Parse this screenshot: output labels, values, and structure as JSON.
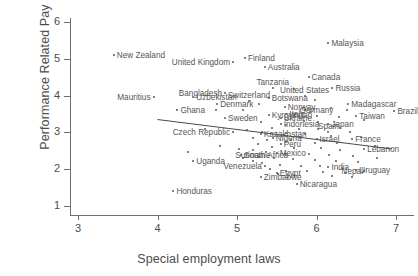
{
  "chart_data": {
    "type": "scatter",
    "title": "",
    "xlabel": "Special employment laws",
    "ylabel": "Performance Related Pay",
    "xlim": [
      3,
      7
    ],
    "ylim": [
      1,
      6
    ],
    "xticks": [
      3,
      4,
      5,
      6,
      7
    ],
    "yticks": [
      1,
      2,
      3,
      4,
      5,
      6
    ],
    "grid": false,
    "legend": "none",
    "fit_line": {
      "label": "linear fit",
      "x_start": 4.0,
      "y_start": 3.35,
      "x_end": 6.95,
      "y_end": 2.55
    },
    "points": [
      {
        "label": "Malaysia",
        "x": 6.15,
        "y": 5.42,
        "label_pos": "right"
      },
      {
        "label": "New Zealand",
        "x": 3.45,
        "y": 5.1,
        "label_pos": "right"
      },
      {
        "label": "Finland",
        "x": 5.1,
        "y": 5.02,
        "label_pos": "right"
      },
      {
        "label": "Australia",
        "x": 5.35,
        "y": 4.78,
        "label_pos": "right"
      },
      {
        "label": "United Kingdom",
        "x": 4.95,
        "y": 4.9,
        "label_pos": "left"
      },
      {
        "label": "Canada",
        "x": 5.9,
        "y": 4.5,
        "label_pos": "right"
      },
      {
        "label": "Russia",
        "x": 6.2,
        "y": 4.2,
        "label_pos": "right"
      },
      {
        "label": "Tanzania",
        "x": 5.45,
        "y": 4.2,
        "label_pos": "center"
      },
      {
        "label": "Bangladesh",
        "x": 4.85,
        "y": 4.08,
        "label_pos": "left"
      },
      {
        "label": "United States",
        "x": 5.85,
        "y": 4.0,
        "label_pos": "center"
      },
      {
        "label": "Mauritius",
        "x": 3.95,
        "y": 3.95,
        "label_pos": "left"
      },
      {
        "label": "Uzbekistan",
        "x": 4.45,
        "y": 3.95,
        "label_pos": "right"
      },
      {
        "label": "Botswana",
        "x": 5.4,
        "y": 3.93,
        "label_pos": "right"
      },
      {
        "label": "Madagascar",
        "x": 6.4,
        "y": 3.78,
        "label_pos": "right"
      },
      {
        "label": "Switzerland",
        "x": 5.15,
        "y": 3.85,
        "label_pos": "center"
      },
      {
        "label": "Denmark",
        "x": 4.75,
        "y": 3.78,
        "label_pos": "right"
      },
      {
        "label": "Norway",
        "x": 5.6,
        "y": 3.7,
        "label_pos": "right"
      },
      {
        "label": "Ghana",
        "x": 4.25,
        "y": 3.62,
        "label_pos": "right"
      },
      {
        "label": "Brazil",
        "x": 6.98,
        "y": 3.58,
        "label_pos": "right"
      },
      {
        "label": "Germany",
        "x": 6.0,
        "y": 3.45,
        "label_pos": "center"
      },
      {
        "label": "Taiwan",
        "x": 6.5,
        "y": 3.45,
        "label_pos": "right"
      },
      {
        "label": "Kyrgyzstan",
        "x": 5.4,
        "y": 3.48,
        "label_pos": "right"
      },
      {
        "label": "Sweden",
        "x": 4.85,
        "y": 3.4,
        "label_pos": "right"
      },
      {
        "label": "Ukraine",
        "x": 5.55,
        "y": 3.38,
        "label_pos": "right"
      },
      {
        "label": "Indonesia",
        "x": 5.55,
        "y": 3.22,
        "label_pos": "right"
      },
      {
        "label": "Italy",
        "x": 5.62,
        "y": 3.5,
        "label_pos": "right"
      },
      {
        "label": "Japan",
        "x": 6.15,
        "y": 3.22,
        "label_pos": "right"
      },
      {
        "label": "Czech Republic",
        "x": 4.95,
        "y": 3.0,
        "label_pos": "left"
      },
      {
        "label": "Kazakhstan",
        "x": 5.3,
        "y": 2.95,
        "label_pos": "right"
      },
      {
        "label": "Spain",
        "x": 6.15,
        "y": 3.0,
        "label_pos": "center"
      },
      {
        "label": "Israel",
        "x": 6.0,
        "y": 2.82,
        "label_pos": "right"
      },
      {
        "label": "France",
        "x": 6.45,
        "y": 2.82,
        "label_pos": "right"
      },
      {
        "label": "Nigeria",
        "x": 5.45,
        "y": 2.85,
        "label_pos": "right"
      },
      {
        "label": "Lebanon",
        "x": 6.6,
        "y": 2.55,
        "label_pos": "right"
      },
      {
        "label": "Peru",
        "x": 5.55,
        "y": 2.68,
        "label_pos": "right"
      },
      {
        "label": "South Africa",
        "x": 5.05,
        "y": 2.38,
        "label_pos": "right"
      },
      {
        "label": "Mexico",
        "x": 5.5,
        "y": 2.45,
        "label_pos": "right"
      },
      {
        "label": "Suriname",
        "x": 5.2,
        "y": 2.22,
        "label_pos": "center"
      },
      {
        "label": "Uganda",
        "x": 4.45,
        "y": 2.22,
        "label_pos": "right"
      },
      {
        "label": "Venezuela",
        "x": 5.35,
        "y": 2.08,
        "label_pos": "left"
      },
      {
        "label": "India",
        "x": 6.15,
        "y": 2.05,
        "label_pos": "right"
      },
      {
        "label": "Uruguay",
        "x": 6.5,
        "y": 1.98,
        "label_pos": "right"
      },
      {
        "label": "Egypt",
        "x": 5.5,
        "y": 1.9,
        "label_pos": "right"
      },
      {
        "label": "Zimbabwe",
        "x": 5.3,
        "y": 1.78,
        "label_pos": "right"
      },
      {
        "label": "Nepal",
        "x": 6.45,
        "y": 1.78,
        "label_pos": "center"
      },
      {
        "label": "Nicaragua",
        "x": 5.75,
        "y": 1.6,
        "label_pos": "right"
      },
      {
        "label": "Honduras",
        "x": 4.2,
        "y": 1.42,
        "label_pos": "right"
      }
    ],
    "unlabeled_points": [
      [
        5.72,
        4.18
      ],
      [
        5.98,
        3.88
      ],
      [
        5.28,
        3.78
      ],
      [
        4.74,
        3.62
      ],
      [
        5.08,
        3.62
      ],
      [
        5.86,
        3.62
      ],
      [
        6.18,
        3.66
      ],
      [
        6.38,
        3.6
      ],
      [
        5.72,
        3.48
      ],
      [
        5.92,
        3.56
      ],
      [
        6.28,
        3.42
      ],
      [
        6.6,
        3.34
      ],
      [
        5.84,
        3.32
      ],
      [
        6.02,
        3.28
      ],
      [
        6.3,
        3.12
      ],
      [
        5.3,
        3.28
      ],
      [
        5.62,
        3.2
      ],
      [
        5.44,
        3.12
      ],
      [
        5.78,
        3.1
      ],
      [
        6.02,
        3.1
      ],
      [
        6.42,
        3.02
      ],
      [
        4.6,
        3.08
      ],
      [
        5.12,
        3.06
      ],
      [
        5.32,
        3.02
      ],
      [
        5.62,
        2.98
      ],
      [
        5.86,
        2.96
      ],
      [
        6.18,
        2.9
      ],
      [
        6.56,
        2.88
      ],
      [
        5.2,
        2.86
      ],
      [
        5.38,
        2.78
      ],
      [
        5.68,
        2.78
      ],
      [
        5.98,
        2.72
      ],
      [
        6.26,
        2.72
      ],
      [
        5.26,
        2.68
      ],
      [
        5.44,
        2.6
      ],
      [
        5.72,
        2.58
      ],
      [
        6.06,
        2.58
      ],
      [
        6.3,
        2.52
      ],
      [
        5.2,
        2.52
      ],
      [
        5.36,
        2.46
      ],
      [
        5.6,
        2.42
      ],
      [
        5.9,
        2.42
      ],
      [
        6.16,
        2.38
      ],
      [
        6.46,
        2.36
      ],
      [
        5.28,
        2.34
      ],
      [
        5.46,
        2.3
      ],
      [
        5.7,
        2.28
      ],
      [
        5.98,
        2.26
      ],
      [
        6.24,
        2.22
      ],
      [
        6.52,
        2.2
      ],
      [
        5.32,
        2.18
      ],
      [
        5.54,
        2.12
      ],
      [
        5.8,
        2.1
      ],
      [
        6.04,
        2.08
      ],
      [
        6.32,
        2.04
      ],
      [
        5.42,
        2.0
      ],
      [
        5.62,
        1.96
      ],
      [
        5.88,
        1.94
      ],
      [
        6.08,
        1.92
      ],
      [
        6.36,
        1.9
      ],
      [
        6.6,
        1.94
      ],
      [
        5.52,
        1.86
      ],
      [
        5.72,
        1.84
      ],
      [
        6.2,
        1.82
      ],
      [
        4.38,
        2.46
      ],
      [
        4.78,
        2.62
      ],
      [
        5.02,
        2.56
      ],
      [
        5.08,
        2.3
      ],
      [
        6.74,
        2.62
      ],
      [
        6.76,
        2.3
      ]
    ]
  }
}
